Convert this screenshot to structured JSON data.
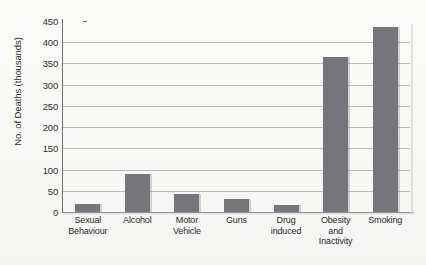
{
  "chart_data": {
    "type": "bar",
    "title": "",
    "xlabel": "",
    "ylabel": "No. of Deaths (thousands)",
    "ylim": [
      0,
      450
    ],
    "ytick_step": 50,
    "grid": true,
    "legend": "none",
    "bar_color": "#76767a",
    "categories": [
      "Sexual Behaviour",
      "Alcohol",
      "Motor Vehicle",
      "Guns",
      "Drug induced",
      "Obesity and Inactivity",
      "Smoking"
    ],
    "category_lines": [
      [
        "Sexual",
        "Behaviour"
      ],
      [
        "Alcohol"
      ],
      [
        "Motor",
        "Vehicle"
      ],
      [
        "Guns"
      ],
      [
        "Drug",
        "induced"
      ],
      [
        "Obesity",
        "and",
        "Inactivity"
      ],
      [
        "Smoking"
      ]
    ],
    "values": [
      20,
      90,
      43,
      30,
      16,
      365,
      435
    ],
    "ytick_labels": [
      "0",
      "50",
      "100",
      "150",
      "200",
      "250",
      "300",
      "350",
      "400",
      "450"
    ],
    "ytick_values": [
      0,
      50,
      100,
      150,
      200,
      250,
      300,
      350,
      400,
      450
    ]
  }
}
